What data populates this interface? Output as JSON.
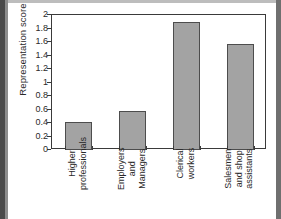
{
  "chart_data": {
    "type": "bar",
    "title": "",
    "xlabel": "",
    "ylabel": "Representation score",
    "ylim": [
      0,
      2
    ],
    "grid": false,
    "legend": "none",
    "categories": [
      "Higher\nprofessionals",
      "Employers\nand\nManagers",
      "Clerical\nworkers",
      "Salesmen\nand shop\nassistants"
    ],
    "values": [
      0.41,
      0.58,
      1.9,
      1.57
    ],
    "ytick_labels": [
      "0",
      "0.2",
      "0.4",
      "0.6",
      "0.8",
      "1",
      "1.2",
      "1.4",
      "1.6",
      "1.8",
      "2"
    ],
    "ytick_values": [
      0,
      0.2,
      0.4,
      0.6,
      0.8,
      1,
      1.2,
      1.4,
      1.6,
      1.8,
      2
    ],
    "bar_color": "#a3a3a3",
    "bar_edge_color": "#4d4d4d",
    "axis_color": "#3a3a3a"
  }
}
